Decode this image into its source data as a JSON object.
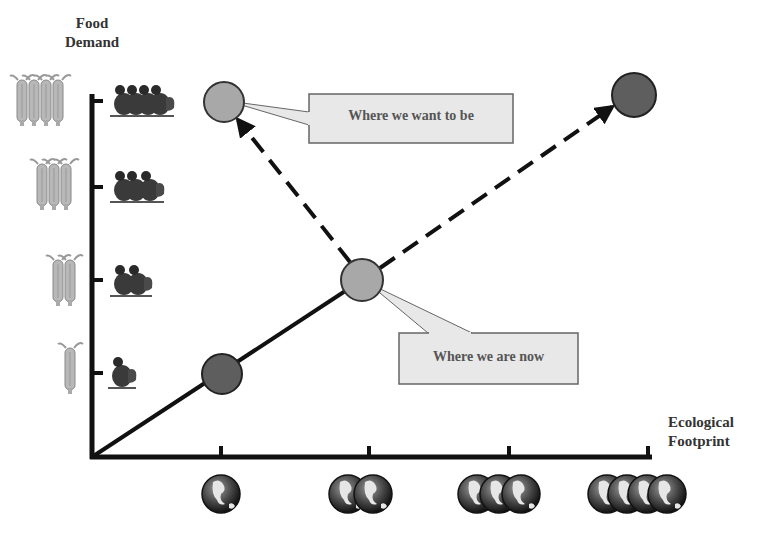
{
  "diagram": {
    "y_axis": {
      "label_line1": "Food",
      "label_line2": "Demand"
    },
    "x_axis": {
      "label_line1": "Ecological",
      "label_line2": "Footprint"
    },
    "y_levels": [
      {
        "level": 1,
        "corn_count": 1,
        "chicken_count": 1
      },
      {
        "level": 2,
        "corn_count": 2,
        "chicken_count": 2
      },
      {
        "level": 3,
        "corn_count": 3,
        "chicken_count": 3
      },
      {
        "level": 4,
        "corn_count": 4,
        "chicken_count": 4
      }
    ],
    "x_levels": [
      {
        "level": 1,
        "globe_count": 1
      },
      {
        "level": 2,
        "globe_count": 2
      },
      {
        "level": 3,
        "globe_count": 3
      },
      {
        "level": 4,
        "globe_count": 4
      }
    ],
    "points": [
      {
        "id": "past",
        "x_level": 1,
        "y_level": 1,
        "color": "#5e5e5e"
      },
      {
        "id": "now",
        "x_level": 2,
        "y_level": 2,
        "color": "#a8a8a8"
      },
      {
        "id": "target",
        "x_level": 1,
        "y_level": 4,
        "color": "#a8a8a8"
      },
      {
        "id": "business-as-usual",
        "x_level": 4,
        "y_level": 4,
        "color": "#5e5e5e"
      }
    ],
    "callouts": {
      "want": {
        "text": "Where we want to be"
      },
      "now": {
        "text": "Where we are now"
      }
    },
    "colors": {
      "axis": "#111111",
      "callout_fill": "#e8e8e8",
      "callout_border": "#666666",
      "dark_point": "#5e5e5e",
      "light_point": "#a8a8a8"
    }
  }
}
